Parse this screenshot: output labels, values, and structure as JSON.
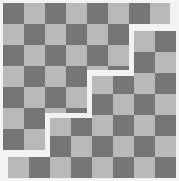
{
  "figure": {
    "width": 179,
    "height": 181,
    "background": "#f3f3f3",
    "colors": {
      "dark": "#767676",
      "light": "#b9b9b9"
    },
    "cell_size": 21,
    "region_a": {
      "origin": [
        3,
        3
      ],
      "cols": 8,
      "rows": 8,
      "dark_when_parity": "even",
      "polygon": [
        [
          3,
          3
        ],
        [
          170,
          3
        ],
        [
          170,
          24
        ],
        [
          129,
          24
        ],
        [
          129,
          70
        ],
        [
          87,
          70
        ],
        [
          87,
          113
        ],
        [
          45,
          113
        ],
        [
          45,
          150
        ],
        [
          3,
          150
        ]
      ]
    },
    "region_b": {
      "origin": [
        8,
        31
      ],
      "cols": 8,
      "rows": 7,
      "dark_when_parity": "odd",
      "polygon": [
        [
          134,
          31
        ],
        [
          176,
          31
        ],
        [
          176,
          178
        ],
        [
          8,
          178
        ],
        [
          8,
          157
        ],
        [
          50,
          157
        ],
        [
          50,
          118
        ],
        [
          92,
          118
        ],
        [
          92,
          76
        ],
        [
          134,
          76
        ]
      ]
    }
  }
}
